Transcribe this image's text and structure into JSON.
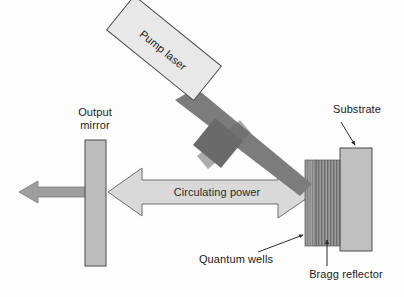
{
  "diagram": {
    "labels": {
      "pump_laser": "Pump laser",
      "output_mirror": "Output\nmirror",
      "output_mirror_line1": "Output",
      "output_mirror_line2": "mirror",
      "circulating_power": "Circulating power",
      "substrate": "Substrate",
      "quantum_wells": "Quantum wells",
      "bragg_reflector": "Bragg reflector"
    },
    "colors": {
      "background": "#fdfdfd",
      "outline": "#3a3a3a",
      "pump_box_fill": "#e8e8e8",
      "beam_dark": "#7c7c7c",
      "beam_cross_dark": "#6a6a6a",
      "mirror_fill": "#bdbdbd",
      "substrate_fill": "#c0c0c0",
      "bragg_fill": "#8c8c8c",
      "quantum_wells_fill": "#9a9a9a",
      "circulating_arrow_fill": "#d9d9d9",
      "output_beam_fill": "#9e9e9e",
      "label_text": "#1b1b1b",
      "leader_line": "#2b2b2b"
    },
    "elements": [
      {
        "name": "pump-laser-box",
        "shape": "rotated-rectangle",
        "rotation_deg": 39
      },
      {
        "name": "pump-beam",
        "shape": "diagonal-bar",
        "direction": "down-right"
      },
      {
        "name": "beam-cross-bar",
        "shape": "perpendicular-bar"
      },
      {
        "name": "output-mirror",
        "shape": "vertical-rectangle"
      },
      {
        "name": "output-beam-arrow",
        "shape": "left-arrow"
      },
      {
        "name": "circulating-power-arrow",
        "shape": "double-headed-arrow"
      },
      {
        "name": "quantum-wells-layer",
        "shape": "striped-block"
      },
      {
        "name": "bragg-reflector-block",
        "shape": "striped-block"
      },
      {
        "name": "substrate-block",
        "shape": "vertical-rectangle"
      },
      {
        "name": "substrate-leader",
        "shape": "arrow-line"
      },
      {
        "name": "quantum-wells-leader",
        "shape": "arrow-line"
      },
      {
        "name": "bragg-reflector-leader",
        "shape": "arrow-line"
      }
    ]
  }
}
